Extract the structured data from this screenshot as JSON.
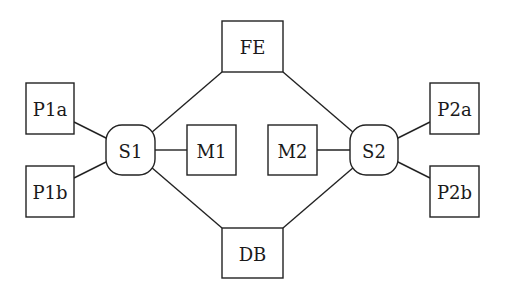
{
  "diagram": {
    "type": "network-topology",
    "nodes": [
      {
        "id": "FE",
        "label": "FE",
        "shape": "rect",
        "x": 222,
        "y": 21,
        "w": 61,
        "h": 51
      },
      {
        "id": "DB",
        "label": "DB",
        "shape": "rect",
        "x": 222,
        "y": 228,
        "w": 61,
        "h": 50
      },
      {
        "id": "P1a",
        "label": "P1a",
        "shape": "rect",
        "x": 26,
        "y": 83,
        "w": 48,
        "h": 51
      },
      {
        "id": "P1b",
        "label": "P1b",
        "shape": "rect",
        "x": 26,
        "y": 166,
        "w": 48,
        "h": 51
      },
      {
        "id": "S1",
        "label": "S1",
        "shape": "rounded-rect",
        "x": 106,
        "y": 125,
        "w": 49,
        "h": 50
      },
      {
        "id": "M1",
        "label": "M1",
        "shape": "rect",
        "x": 187,
        "y": 125,
        "w": 49,
        "h": 50
      },
      {
        "id": "M2",
        "label": "M2",
        "shape": "rect",
        "x": 268,
        "y": 125,
        "w": 49,
        "h": 50
      },
      {
        "id": "S2",
        "label": "S2",
        "shape": "rounded-rect",
        "x": 350,
        "y": 125,
        "w": 48,
        "h": 50
      },
      {
        "id": "P2a",
        "label": "P2a",
        "shape": "rect",
        "x": 430,
        "y": 83,
        "w": 49,
        "h": 51
      },
      {
        "id": "P2b",
        "label": "P2b",
        "shape": "rect",
        "x": 430,
        "y": 166,
        "w": 49,
        "h": 51
      }
    ],
    "edges": [
      {
        "from": "P1a",
        "to": "S1",
        "x1": 74,
        "y1": 122,
        "x2": 108,
        "y2": 139
      },
      {
        "from": "P1b",
        "to": "S1",
        "x1": 74,
        "y1": 178,
        "x2": 108,
        "y2": 161
      },
      {
        "from": "S1",
        "to": "M1",
        "x1": 155,
        "y1": 150,
        "x2": 187,
        "y2": 150
      },
      {
        "from": "S1",
        "to": "FE",
        "x1": 151,
        "y1": 133,
        "x2": 222,
        "y2": 72
      },
      {
        "from": "S1",
        "to": "DB",
        "x1": 151,
        "y1": 167,
        "x2": 222,
        "y2": 228
      },
      {
        "from": "M2",
        "to": "S2",
        "x1": 317,
        "y1": 150,
        "x2": 350,
        "y2": 150
      },
      {
        "from": "FE",
        "to": "S2",
        "x1": 283,
        "y1": 72,
        "x2": 354,
        "y2": 133
      },
      {
        "from": "DB",
        "to": "S2",
        "x1": 283,
        "y1": 228,
        "x2": 354,
        "y2": 167
      },
      {
        "from": "S2",
        "to": "P2a",
        "x1": 396,
        "y1": 139,
        "x2": 430,
        "y2": 122
      },
      {
        "from": "S2",
        "to": "P2b",
        "x1": 396,
        "y1": 161,
        "x2": 430,
        "y2": 178
      }
    ]
  }
}
